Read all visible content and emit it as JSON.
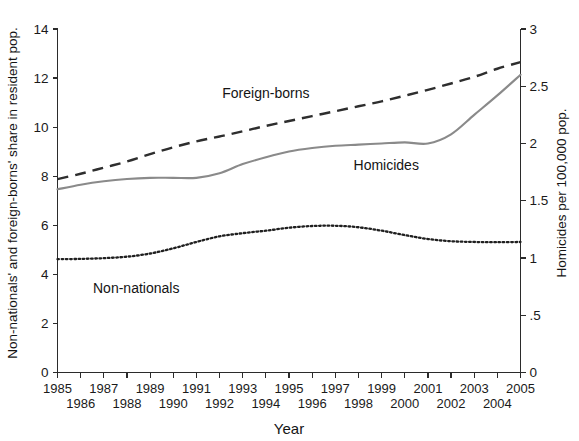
{
  "chart_data": {
    "type": "line",
    "title": "",
    "xlabel": "Year",
    "ylabel": "Non-nationals' and foreign-borns' share in resident pop.",
    "ylabel_right": "Homicides per 100,000 pop.",
    "x": [
      1985,
      1986,
      1987,
      1988,
      1989,
      1990,
      1991,
      1992,
      1993,
      1994,
      1995,
      1996,
      1997,
      1998,
      1999,
      2000,
      2001,
      2002,
      2003,
      2004,
      2005
    ],
    "xlim": [
      1985,
      2005
    ],
    "xticklabels_top": [
      "1985",
      "1987",
      "1989",
      "1991",
      "1993",
      "1995",
      "1997",
      "1999",
      "2001",
      "2003",
      "2005"
    ],
    "xticklabels_bottom": [
      "1986",
      "1988",
      "1990",
      "1992",
      "1994",
      "1996",
      "1998",
      "2000",
      "2002",
      "2004"
    ],
    "ylim": [
      0,
      14
    ],
    "yticks": [
      0,
      2,
      4,
      6,
      8,
      10,
      12,
      14
    ],
    "yticklabels": [
      "0",
      "2",
      "4",
      "6",
      "8",
      "10",
      "12",
      "14"
    ],
    "ylim_right": [
      0,
      3
    ],
    "yticks_right": [
      0,
      0.5,
      1,
      1.5,
      2,
      2.5,
      3
    ],
    "yticklabels_right": [
      "0",
      ".5",
      "1",
      "1.5",
      "2",
      "2.5",
      "3"
    ],
    "grid": false,
    "legend_position": "inline-annotations",
    "series": [
      {
        "name": "Foreign-borns",
        "axis": "left",
        "style": "dashed",
        "color": "#2e2e2e",
        "label_x": 1994.0,
        "label_y": 11.4,
        "values": [
          7.88,
          8.1,
          8.35,
          8.6,
          8.9,
          9.18,
          9.42,
          9.62,
          9.83,
          10.05,
          10.25,
          10.45,
          10.65,
          10.85,
          11.05,
          11.28,
          11.52,
          11.78,
          12.05,
          12.38,
          12.65
        ]
      },
      {
        "name": "Homicides",
        "axis": "right",
        "style": "solid",
        "color": "#8a8a8a",
        "label_x": 1999.2,
        "label_y": 8.45,
        "values_right_axis": [
          1.6,
          1.64,
          1.67,
          1.69,
          1.7,
          1.7,
          1.7,
          1.74,
          1.82,
          1.88,
          1.93,
          1.96,
          1.98,
          1.99,
          2.0,
          2.01,
          2.0,
          2.08,
          2.25,
          2.42,
          2.6
        ],
        "values_left_axis_equivalent": [
          7.47,
          7.65,
          7.78,
          7.87,
          7.91,
          7.91,
          7.93,
          8.12,
          8.48,
          8.76,
          9.0,
          9.13,
          9.22,
          9.27,
          9.32,
          9.36,
          9.31,
          9.71,
          10.5,
          11.3,
          12.15
        ]
      },
      {
        "name": "Non-nationals",
        "axis": "left",
        "style": "dotted",
        "color": "#1f1f1f",
        "label_x": 1988.4,
        "label_y": 3.45,
        "values": [
          4.62,
          4.63,
          4.66,
          4.72,
          4.85,
          5.06,
          5.32,
          5.55,
          5.68,
          5.78,
          5.9,
          5.97,
          5.98,
          5.92,
          5.78,
          5.6,
          5.44,
          5.35,
          5.32,
          5.31,
          5.32
        ]
      }
    ],
    "annotations": [
      {
        "text": "Foreign-borns",
        "x": 1994.0,
        "y": 11.4
      },
      {
        "text": "Homicides",
        "x": 1999.2,
        "y": 8.45
      },
      {
        "text": "Non-nationals",
        "x": 1988.4,
        "y": 3.45
      }
    ]
  },
  "axes": {
    "x_title": "Year",
    "y_left_title": "Non-nationals' and foreign-borns' share in resident pop.",
    "y_right_title": "Homicides per 100,000 pop."
  },
  "colors": {
    "background": "#ffffff",
    "axis": "#2b2b2b",
    "solid_series": "#8a8a8a",
    "dashed_series": "#2e2e2e",
    "dotted_series": "#1f1f1f",
    "text": "#141414"
  }
}
